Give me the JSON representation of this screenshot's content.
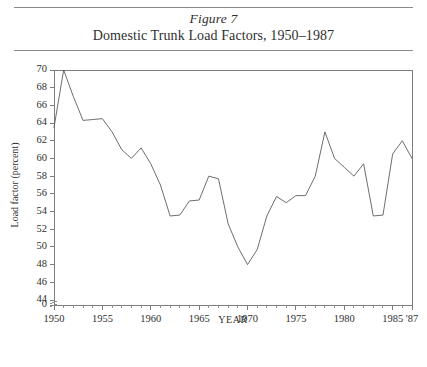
{
  "figure": {
    "label": "Figure 7",
    "title": "Domestic Trunk Load Factors, 1950–1987"
  },
  "chart_data": {
    "type": "line",
    "title": "Domestic Trunk Load Factors, 1950–1987",
    "xlabel": "YEAR",
    "ylabel": "Load factor (percent)",
    "xlim": [
      1950,
      1987
    ],
    "ylim": [
      44,
      70
    ],
    "y_axis_break": true,
    "y_zero_label": "0",
    "ytick_labels": [
      "0",
      "44",
      "46",
      "48",
      "50",
      "52",
      "54",
      "56",
      "58",
      "60",
      "62",
      "64",
      "66",
      "68",
      "70"
    ],
    "yticks": [
      44,
      46,
      48,
      50,
      52,
      54,
      56,
      58,
      60,
      62,
      64,
      66,
      68,
      70
    ],
    "xtick_labels": [
      "1950",
      "1955",
      "1960",
      "1965",
      "1970",
      "1975",
      "1980",
      "1985",
      "'87"
    ],
    "xticks": [
      1950,
      1955,
      1960,
      1965,
      1970,
      1975,
      1980,
      1985,
      1987
    ],
    "x_minor_ticks_every": 1,
    "grid": false,
    "legend": null,
    "line_color": "#5c5c5c",
    "x": [
      1950,
      1951,
      1952,
      1953,
      1954,
      1955,
      1956,
      1957,
      1958,
      1959,
      1960,
      1961,
      1962,
      1963,
      1964,
      1965,
      1966,
      1967,
      1968,
      1969,
      1970,
      1971,
      1972,
      1973,
      1974,
      1975,
      1976,
      1977,
      1978,
      1979,
      1980,
      1981,
      1982,
      1983,
      1984,
      1985,
      1986,
      1987
    ],
    "values": [
      63.5,
      70.0,
      67.0,
      64.3,
      64.4,
      64.5,
      63.0,
      61.0,
      60.0,
      61.2,
      59.4,
      57.0,
      53.5,
      53.6,
      55.2,
      55.3,
      58.0,
      57.7,
      52.6,
      50.0,
      48.0,
      49.7,
      53.5,
      55.7,
      55.0,
      55.8,
      55.8,
      58.0,
      63.0,
      60.0,
      59.0,
      58.0,
      59.4,
      53.5,
      53.6,
      60.5,
      62.0,
      60.0
    ]
  },
  "axis_break_marker": "≈"
}
